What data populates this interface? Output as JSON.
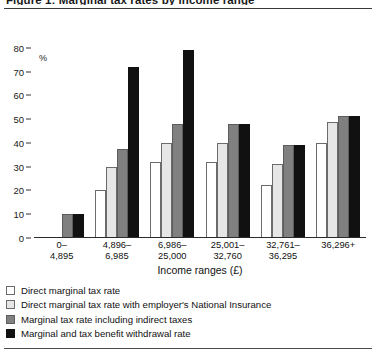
{
  "figure": {
    "clipped_title": "Figure 1: Marginal tax rates by income range",
    "y_unit": "%"
  },
  "chart_data": {
    "type": "bar",
    "title": "",
    "xlabel": "Income ranges (£)",
    "ylabel": "%",
    "ylim": [
      0,
      85
    ],
    "yticks": [
      0,
      10,
      20,
      30,
      40,
      50,
      60,
      70,
      80
    ],
    "ytick_labels": [
      "0",
      "10",
      "20",
      "30",
      "40",
      "50",
      "60",
      "70",
      "80"
    ],
    "grid": false,
    "legend_position": "below",
    "categories": [
      "0–\n4,895",
      "4,896–\n6,985",
      "6,986–\n25,000",
      "25,001–\n32,760",
      "32,761–\n36,295",
      "36,296+"
    ],
    "category_lines": [
      [
        "0–",
        "4,895"
      ],
      [
        "4,896–",
        "6,985"
      ],
      [
        "6,986–",
        "25,000"
      ],
      [
        "25,001–",
        "32,760"
      ],
      [
        "32,761–",
        "36,295"
      ],
      [
        "36,296+",
        ""
      ]
    ],
    "series": [
      {
        "name": "Direct marginal tax rate",
        "color": "#ffffff",
        "values": [
          0,
          20,
          32,
          32,
          22.5,
          40
        ]
      },
      {
        "name": "Direct marginal tax rate with employer's National Insurance",
        "color": "#e6e6e6",
        "values": [
          0,
          30,
          40,
          40,
          31,
          49
        ]
      },
      {
        "name": "Marginal tax rate including indirect taxes",
        "color": "#808080",
        "values": [
          10,
          37.5,
          48,
          48,
          39,
          51.5
        ]
      },
      {
        "name": "Marginal and tax benefit withdrawal rate",
        "color": "#111111",
        "values": [
          10,
          72,
          79,
          48,
          39,
          51.5
        ]
      }
    ]
  }
}
